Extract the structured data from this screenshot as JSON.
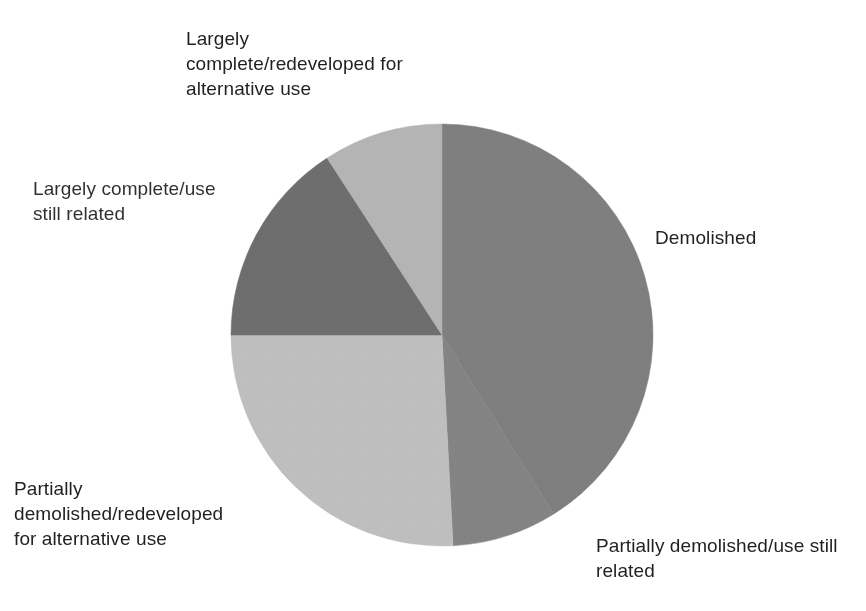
{
  "chart_data": {
    "type": "pie",
    "title": "",
    "subtitle": "",
    "xlabel": "",
    "ylabel": "",
    "legend_position": "none",
    "labels_position": "outside-callout-free",
    "grid": false,
    "start_angle_deg": 0,
    "direction": "clockwise",
    "categories": [
      "Demolished",
      "Partially demolished/use still related",
      "Partially demolished/redeveloped for alternative use",
      "Largely complete/use still related",
      "Largely complete/redeveloped for alternative use"
    ],
    "values": [
      41,
      8,
      26,
      16,
      9
    ],
    "value_unit": "percent",
    "slices": [
      {
        "label": "Demolished",
        "value": 41,
        "start_angle_deg": 0,
        "end_angle_deg": 148,
        "color": "#7f7f7f"
      },
      {
        "label": "Partially demolished/use still related",
        "value": 8,
        "start_angle_deg": 148,
        "end_angle_deg": 177,
        "color": "#848484"
      },
      {
        "label": "Partially demolished/redeveloped for alternative use",
        "value": 26,
        "start_angle_deg": 177,
        "end_angle_deg": 270,
        "color": "#bfbfbf"
      },
      {
        "label": "Largely complete/use still related",
        "value": 16,
        "start_angle_deg": 270,
        "end_angle_deg": 327,
        "color": "#6e6e6e"
      },
      {
        "label": "Largely complete/redeveloped for alternative use",
        "value": 9,
        "start_angle_deg": 327,
        "end_angle_deg": 360,
        "color": "#b5b5b5"
      }
    ]
  },
  "labels": {
    "largely_complete_redeveloped": "Largely\ncomplete/redeveloped for\nalternative use",
    "largely_complete_use_still_related": "Largely complete/use\nstill related",
    "demolished": "Demolished",
    "partially_demolished_redeveloped": "Partially\ndemolished/redeveloped\nfor alternative use",
    "partially_demolished_use_still_related": "Partially demolished/use still\nrelated"
  },
  "colors": {
    "background": "#ffffff",
    "text": "#221f1f",
    "slice_dark": "#7f7f7f",
    "slice_dark_alt": "#848484",
    "slice_darkest": "#6e6e6e",
    "slice_light": "#bfbfbf",
    "slice_light_alt": "#b5b5b5"
  },
  "geometry": {
    "center_x": 212,
    "center_y": 212,
    "radius": 211
  }
}
